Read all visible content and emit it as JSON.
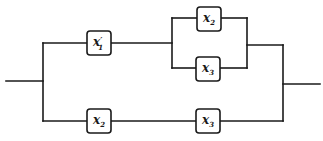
{
  "diagram": {
    "type": "switching-circuit",
    "colors": {
      "line": "#1a1a1a",
      "background": "#ffffff"
    },
    "switches": [
      {
        "id": "s1",
        "var": "x",
        "sub": "1",
        "prime": "′",
        "branch": "upper",
        "position": "series-left"
      },
      {
        "id": "s2",
        "var": "x",
        "sub": "2",
        "prime": "",
        "branch": "upper",
        "position": "parallel-top"
      },
      {
        "id": "s3",
        "var": "x",
        "sub": "3",
        "prime": "",
        "branch": "upper",
        "position": "parallel-bottom"
      },
      {
        "id": "s4",
        "var": "x",
        "sub": "2",
        "prime": "",
        "branch": "lower",
        "position": "series-left"
      },
      {
        "id": "s5",
        "var": "x",
        "sub": "3",
        "prime": "",
        "branch": "lower",
        "position": "series-right"
      }
    ],
    "expression": "x1'(x2 + x3) + x2 x3"
  }
}
